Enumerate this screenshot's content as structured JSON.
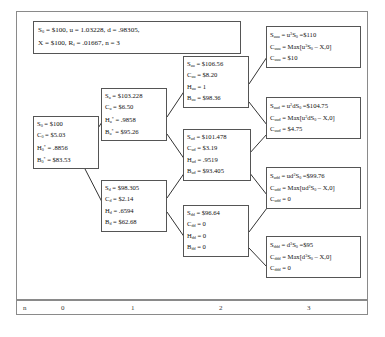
{
  "diagram": {
    "parameters_box": {
      "name": "parameters",
      "line1_html": "S<sub>0</sub> = $100, u = 1.03228, d = .98305,",
      "line2_html": "X = $100, R<sub>f</sub> = .01667,  n = 3",
      "S0": "$100",
      "u": "1.03228",
      "d": ".98305",
      "X": "$100",
      "Rf": ".01667",
      "n": "3"
    },
    "nodes": [
      {
        "id": "root",
        "name": "node-root",
        "lines": [
          "S<sub>0</sub> = $100",
          "C<sub>0</sub> = $5.03",
          "H<sub>0</sub><sup>*</sup> = .8856",
          "B<sub>0</sub><sup>*</sup> = $83.53"
        ]
      },
      {
        "id": "u",
        "name": "node-u",
        "lines": [
          "S<sub>u</sub> = $103.228",
          "C<sub>u</sub> = $6.50",
          "H<sub>u</sub><sup>*</sup> = .9858",
          "B<sub>u</sub><sup>*</sup> = $95.26"
        ]
      },
      {
        "id": "d",
        "name": "node-d",
        "lines": [
          "S<sub>d</sub> = $98.305",
          "C<sub>d</sub> = $2.14",
          "H<sub>d</sub> = .6594",
          "B<sub>d</sub> = $62.68"
        ]
      },
      {
        "id": "uu",
        "name": "node-uu",
        "lines": [
          "S<sub>uu</sub> = $106.56",
          "C<sub>uu</sub> = $8.20",
          "H<sub>uu</sub> = 1",
          "B<sub>uu</sub> = $98.36"
        ]
      },
      {
        "id": "ud",
        "name": "node-ud",
        "lines": [
          "S<sub>ud</sub> = $101.478",
          "C<sub>ud</sub> = $3.19",
          "H<sub>ud</sub> = .9519",
          "B<sub>ud</sub> = $93.405"
        ]
      },
      {
        "id": "dd",
        "name": "node-dd",
        "lines": [
          "S<sub>dd</sub> = $96.64",
          "C<sub>dd</sub> = 0",
          "H<sub>dd</sub> = 0",
          "B<sub>dd</sub> = 0"
        ]
      },
      {
        "id": "uuu",
        "name": "node-uuu",
        "lines": [
          "S<sub>uuu</sub> = u<sup>3</sup>S<sub>0</sub> =$110",
          "C<sub>uuu</sub> = Max[u<sup>3</sup>S<sub>0</sub> &#8211; X,0]",
          "C<sub>uuu</sub> = $10"
        ]
      },
      {
        "id": "uud",
        "name": "node-uud",
        "lines": [
          "S<sub>uud</sub> = u<sup>2</sup>dS<sub>0</sub> =$104.75",
          "C<sub>uud</sub> = Max[u<sup>2</sup>dS<sub>0</sub> &#8211; X,0]",
          "C<sub>uud</sub> = $4.75"
        ]
      },
      {
        "id": "udd",
        "name": "node-udd",
        "lines": [
          "S<sub>udd</sub> = ud<sup>2</sup>S<sub>0</sub> =$99.76",
          "C<sub>udd</sub> = Max[ud<sup>2</sup>S<sub>0</sub> &#8211; X,0]",
          "C<sub>udd</sub> = 0"
        ]
      },
      {
        "id": "ddd",
        "name": "node-ddd",
        "lines": [
          "S<sub>ddd</sub> = d<sup>3</sup>S<sub>0</sub> =$95",
          "C<sub>ddd</sub> = Max[d<sup>3</sup>S<sub>0</sub> &#8211; X,0]",
          "C<sub>ddd</sub> = 0"
        ]
      }
    ],
    "axis": {
      "name": "period-axis",
      "label": "n",
      "ticks": [
        "0",
        "1",
        "2",
        "3"
      ]
    },
    "colors": {
      "frame_border": "#8a8a8a",
      "node_border": "#555555",
      "connector": "#333333",
      "text": "#111111",
      "background": "#ffffff"
    }
  }
}
